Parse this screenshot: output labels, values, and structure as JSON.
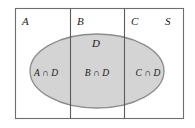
{
  "figure": {
    "kind": "venn-diagram",
    "alt_title": "Partition of universal set S into A, B, C intersected with D",
    "colors": {
      "background": "#ffffff",
      "ellipse_fill": "#d4d4d4",
      "ellipse_stroke": "#8c8c8c",
      "border_stroke": "#6e6e6e",
      "divider_stroke": "#5a5a5a",
      "text": "#1a1a1a"
    }
  },
  "universal_set": {
    "label": "S",
    "box": {
      "x": 15,
      "y": 8,
      "width": 169,
      "height": 111
    }
  },
  "partitions": [
    {
      "id": "A",
      "label": "A",
      "label_x": 22,
      "label_y": 25,
      "cell_x": 15,
      "cell_width": 55
    },
    {
      "id": "B",
      "label": "B",
      "label_x": 77,
      "label_y": 25,
      "cell_x": 70,
      "cell_width": 54
    },
    {
      "id": "C",
      "label": "C",
      "label_x": 131,
      "label_y": 25,
      "cell_x": 124,
      "cell_width": 60
    }
  ],
  "universal_label": {
    "label": "S",
    "label_x": 165,
    "label_y": 25
  },
  "dividers": [
    {
      "id": "divider-a-b",
      "x": 70
    },
    {
      "id": "divider-b-c",
      "x": 124
    }
  ],
  "ellipse": {
    "label": "D",
    "label_x": 96,
    "label_y": 47,
    "cx": 97,
    "cy": 71,
    "rx": 67,
    "ry": 37
  },
  "regions": [
    {
      "id": "A-and-D",
      "label": "A ∩ D",
      "label_x": 46,
      "label_y": 76
    },
    {
      "id": "B-and-D",
      "label": "B ∩ D",
      "label_x": 97,
      "label_y": 76
    },
    {
      "id": "C-and-D",
      "label": "C ∩ D",
      "label_x": 148,
      "label_y": 76
    }
  ]
}
